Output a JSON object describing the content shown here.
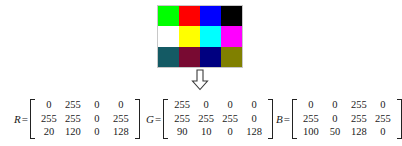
{
  "figure": {
    "background_color": "#ffffff",
    "text_color": "#1a1a1a"
  },
  "image": {
    "name": "rgb-color-image",
    "rows": 3,
    "cols": 4,
    "border_color": "#c8c8c8",
    "pixels": [
      [
        {
          "label": "r0c0",
          "rgb": "rgb(0,255,0)"
        },
        {
          "label": "r0c1",
          "rgb": "rgb(255,0,0)"
        },
        {
          "label": "r0c2",
          "rgb": "rgb(0,0,255)"
        },
        {
          "label": "r0c3",
          "rgb": "rgb(0,0,0)"
        }
      ],
      [
        {
          "label": "r1c0",
          "rgb": "rgb(255,255,255)"
        },
        {
          "label": "r1c1",
          "rgb": "rgb(255,255,0)"
        },
        {
          "label": "r1c2",
          "rgb": "rgb(0,255,255)"
        },
        {
          "label": "r1c3",
          "rgb": "rgb(255,0,255)"
        }
      ],
      [
        {
          "label": "r2c0",
          "rgb": "rgb(20,90,100)"
        },
        {
          "label": "r2c1",
          "rgb": "rgb(120,10,50)"
        },
        {
          "label": "r2c2",
          "rgb": "rgb(0,0,128)"
        },
        {
          "label": "r2c3",
          "rgb": "rgb(128,128,0)"
        }
      ]
    ]
  },
  "arrow": {
    "name": "down-arrow-icon",
    "direction": "down",
    "stroke_color": "#3a3a3a",
    "fill_color": "#ffffff"
  },
  "matrices": [
    {
      "id": "r",
      "label": "R",
      "equals": "=",
      "rows": [
        [
          "0",
          "255",
          "0",
          "0"
        ],
        [
          "255",
          "255",
          "0",
          "255"
        ],
        [
          "20",
          "120",
          "0",
          "128"
        ]
      ]
    },
    {
      "id": "g",
      "label": "G",
      "equals": "=",
      "rows": [
        [
          "255",
          "0",
          "0",
          "0"
        ],
        [
          "255",
          "255",
          "255",
          "0"
        ],
        [
          "90",
          "10",
          "0",
          "128"
        ]
      ]
    },
    {
      "id": "b",
      "label": "B",
      "equals": "=",
      "rows": [
        [
          "0",
          "0",
          "255",
          "0"
        ],
        [
          "255",
          "0",
          "255",
          "255"
        ],
        [
          "100",
          "50",
          "128",
          "0"
        ]
      ]
    }
  ]
}
